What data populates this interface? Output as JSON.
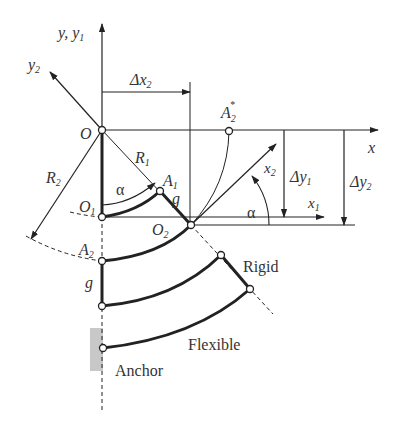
{
  "diagram": {
    "type": "mechanism-kinematic-diagram",
    "axes": {
      "y_label": "y, y",
      "y_sub": "1",
      "y2_label": "y",
      "y2_sub": "2",
      "x_label": "x",
      "x1_label": "x",
      "x1_sub": "1",
      "x2_label": "x",
      "x2_sub": "2"
    },
    "points": {
      "O": "O",
      "O1": "O",
      "O1_sub": "1",
      "O2": "O",
      "O2_sub": "2",
      "A1": "A",
      "A1_sub": "1",
      "A2": "A",
      "A2_sub": "2",
      "A2star": "A",
      "A2star_sub": "2",
      "A2star_sup": "*"
    },
    "dimensions": {
      "dx2": "Δx",
      "dx2_sub": "2",
      "dy1": "Δy",
      "dy1_sub": "1",
      "dy2": "Δy",
      "dy2_sub": "2",
      "R1": "R",
      "R1_sub": "1",
      "R2": "R",
      "R2_sub": "2",
      "alpha": "α",
      "g": "g"
    },
    "labels": {
      "rigid": "Rigid",
      "flexible": "Flexible",
      "anchor": "Anchor"
    },
    "colors": {
      "line": "#222222",
      "text": "#333333",
      "anchor_fill": "#c8c8c8"
    }
  }
}
